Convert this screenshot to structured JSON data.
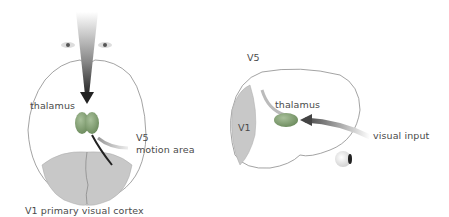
{
  "figure": {
    "left_view": {
      "description": "top view of brain",
      "labels": {
        "thalamus": "thalamus",
        "v5": "V5",
        "motion_area": "motion area",
        "v1_caption": "V1 primary visual cortex"
      }
    },
    "right_view": {
      "description": "side view of brain",
      "labels": {
        "v5": "V5",
        "thalamus": "thalamus",
        "v1": "V1",
        "visual_input": "visual input"
      }
    },
    "colors": {
      "outline": "#8c8c8c",
      "cortex_fill": "#c8c8c8",
      "thalamus_fill": "#7a9a6a",
      "arrow_dark": "#333333",
      "text": "#4a4a4a"
    }
  }
}
